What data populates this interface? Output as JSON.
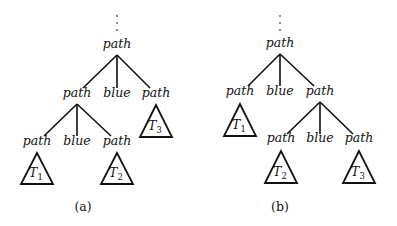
{
  "figure": {
    "panels": [
      {
        "caption": "(a)",
        "root": {
          "label": "path",
          "x": 117,
          "y": 48
        },
        "ellipsis_dots": {
          "x": 117,
          "ys": [
            16,
            23,
            30
          ]
        },
        "nodes": [
          {
            "id": "a_l1_path_left",
            "label": "path",
            "x": 77,
            "y": 97
          },
          {
            "id": "a_l1_blue",
            "label": "blue",
            "x": 117,
            "y": 97
          },
          {
            "id": "a_l1_path_right",
            "label": "path",
            "x": 156,
            "y": 97
          },
          {
            "id": "a_l2_path_left",
            "label": "path",
            "x": 37,
            "y": 145
          },
          {
            "id": "a_l2_blue",
            "label": "blue",
            "x": 77,
            "y": 145
          },
          {
            "id": "a_l2_path_right",
            "label": "path",
            "x": 117,
            "y": 145
          }
        ],
        "subtrees": [
          {
            "name": "T",
            "sub": "3",
            "cx": 156,
            "apex_y": 105,
            "base_y": 137,
            "half_w": 16
          },
          {
            "name": "T",
            "sub": "1",
            "cx": 37,
            "apex_y": 153,
            "base_y": 184,
            "half_w": 16
          },
          {
            "name": "T",
            "sub": "2",
            "cx": 117,
            "apex_y": 153,
            "base_y": 184,
            "half_w": 16
          }
        ],
        "edges": [
          [
            117,
            55,
            83,
            88
          ],
          [
            117,
            55,
            117,
            88
          ],
          [
            117,
            55,
            150,
            88
          ],
          [
            77,
            104,
            44,
            136
          ],
          [
            77,
            104,
            77,
            136
          ],
          [
            77,
            104,
            111,
            136
          ]
        ]
      },
      {
        "caption": "(b)",
        "root": {
          "label": "path",
          "x": 280,
          "y": 47
        },
        "ellipsis_dots": {
          "x": 280,
          "ys": [
            16,
            23,
            30
          ]
        },
        "nodes": [
          {
            "id": "b_l1_path_left",
            "label": "path",
            "x": 240,
            "y": 95
          },
          {
            "id": "b_l1_blue",
            "label": "blue",
            "x": 280,
            "y": 95
          },
          {
            "id": "b_l1_path_right",
            "label": "path",
            "x": 320,
            "y": 95
          },
          {
            "id": "b_l2_path_left",
            "label": "path",
            "x": 281,
            "y": 142
          },
          {
            "id": "b_l2_blue",
            "label": "blue",
            "x": 320,
            "y": 142
          },
          {
            "id": "b_l2_path_right",
            "label": "path",
            "x": 359,
            "y": 142
          }
        ],
        "subtrees": [
          {
            "name": "T",
            "sub": "1",
            "cx": 240,
            "apex_y": 104,
            "base_y": 136,
            "half_w": 16
          },
          {
            "name": "T",
            "sub": "2",
            "cx": 281,
            "apex_y": 151,
            "base_y": 183,
            "half_w": 16
          },
          {
            "name": "T",
            "sub": "3",
            "cx": 359,
            "apex_y": 151,
            "base_y": 183,
            "half_w": 16
          }
        ],
        "edges": [
          [
            280,
            54,
            248,
            86
          ],
          [
            280,
            54,
            280,
            86
          ],
          [
            280,
            54,
            314,
            86
          ],
          [
            320,
            102,
            287,
            134
          ],
          [
            320,
            102,
            320,
            134
          ],
          [
            320,
            102,
            353,
            134
          ]
        ]
      }
    ]
  }
}
